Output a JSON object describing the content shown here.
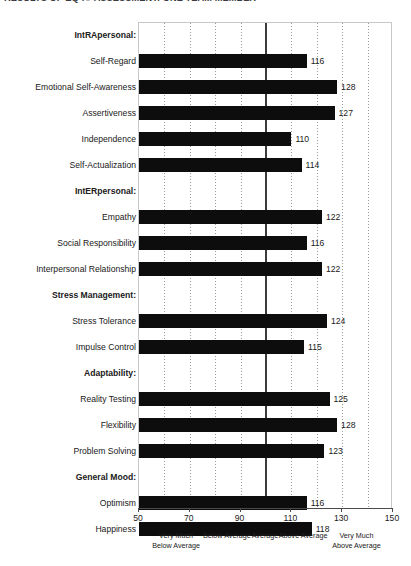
{
  "title": "RESULTS OF EQ-i® ASSESSMENT: ONE TEAM MEMBER",
  "chart_data": {
    "type": "bar",
    "orientation": "horizontal",
    "title": "RESULTS OF EQ-i® ASSESSMENT: ONE TEAM MEMBER",
    "xlabel": "",
    "ylabel": "",
    "xlim": [
      50,
      150
    ],
    "grid": true,
    "gridline_interval": 10,
    "reference_line": 100,
    "legend": "none",
    "xticks": [
      50,
      70,
      90,
      110,
      130,
      150
    ],
    "xtick_labels": [
      "50",
      "70",
      "90",
      "110",
      "130",
      "150"
    ],
    "band_labels": [
      {
        "line1": "Very Much",
        "line2": "Below Average",
        "center": 65
      },
      {
        "line1": "Below Average",
        "line2": "",
        "center": 85
      },
      {
        "line1": "Average",
        "line2": "",
        "center": 100
      },
      {
        "line1": "Above Average",
        "line2": "",
        "center": 115
      },
      {
        "line1": "Very Much",
        "line2": "Above Average",
        "center": 136
      }
    ],
    "categories": [
      "IntRApersonal:",
      "Self-Regard",
      "Emotional Self-Awareness",
      "Assertiveness",
      "Independence",
      "Self-Actualization",
      "IntERpersonal:",
      "Empathy",
      "Social Responsibility",
      "Interpersonal Relationship",
      "Stress Management:",
      "Stress Tolerance",
      "Impulse Control",
      "Adaptability:",
      "Reality Testing",
      "Flexibility",
      "Problem Solving",
      "General Mood:",
      "Optimism",
      "Happiness"
    ],
    "values": [
      null,
      116,
      128,
      127,
      110,
      114,
      null,
      122,
      116,
      122,
      null,
      124,
      115,
      null,
      125,
      128,
      123,
      null,
      116,
      118
    ],
    "groups": [
      {
        "header": "IntRApersonal:",
        "items": [
          "Self-Regard",
          "Emotional Self-Awareness",
          "Assertiveness",
          "Independence",
          "Self-Actualization"
        ]
      },
      {
        "header": "IntERpersonal:",
        "items": [
          "Empathy",
          "Social Responsibility",
          "Interpersonal Relationship"
        ]
      },
      {
        "header": "Stress Management:",
        "items": [
          "Stress Tolerance",
          "Impulse Control"
        ]
      },
      {
        "header": "Adaptability:",
        "items": [
          "Reality Testing",
          "Flexibility",
          "Problem Solving"
        ]
      },
      {
        "header": "General Mood:",
        "items": [
          "Optimism",
          "Happiness"
        ]
      }
    ]
  },
  "colors": {
    "bar": "#0d0d0d",
    "reference_line": "#3b3b3b",
    "gridline": "#9a9a9a",
    "axis": "#4a4a4a",
    "text": "#202020",
    "background": "#ffffff"
  }
}
